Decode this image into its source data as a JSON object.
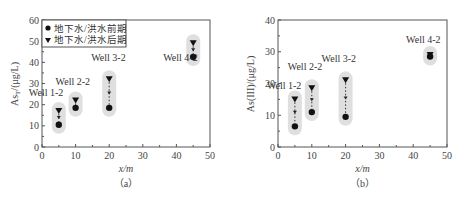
{
  "chart_data": [
    {
      "type": "scatter",
      "panel": "(a)",
      "title": "",
      "xlabel": "x/m",
      "ylabel": "As_T/(μg/L)",
      "xlim": [
        0,
        50
      ],
      "ylim": [
        0,
        60
      ],
      "xticks": [
        0,
        10,
        20,
        30,
        40,
        50
      ],
      "yticks": [
        0,
        10,
        20,
        30,
        40,
        50,
        60
      ],
      "legend": [
        "地下水/洪水前期",
        "地下水/洪水后期"
      ],
      "legend_position": "upper left",
      "grid": false,
      "series": [
        {
          "name": "地下水/洪水前期",
          "marker": "circle",
          "x": [
            5,
            10,
            20,
            45
          ],
          "values": [
            10.5,
            18.5,
            18.5,
            42.5
          ]
        },
        {
          "name": "地下水/洪水后期",
          "marker": "triangle-down",
          "x": [
            5,
            10,
            20,
            45
          ],
          "values": [
            17,
            22,
            32,
            49
          ]
        }
      ],
      "annotations": [
        {
          "text": "Well 1-2",
          "x": 5
        },
        {
          "text": "Well 2-2",
          "x": 10
        },
        {
          "text": "Well 3-2",
          "x": 20
        },
        {
          "text": "Well 4-2",
          "x": 45
        }
      ]
    },
    {
      "type": "scatter",
      "panel": "(b)",
      "title": "",
      "xlabel": "x/m",
      "ylabel": "As(III)/(μg/L)",
      "xlim": [
        0,
        50
      ],
      "ylim": [
        0,
        40
      ],
      "xticks": [
        0,
        10,
        20,
        30,
        40,
        50
      ],
      "yticks": [
        0,
        10,
        20,
        30,
        40
      ],
      "legend": [],
      "grid": false,
      "series": [
        {
          "name": "地下水/洪水前期",
          "marker": "circle",
          "x": [
            5,
            10,
            20,
            45
          ],
          "values": [
            6.5,
            11,
            9.5,
            28.5
          ]
        },
        {
          "name": "地下水/洪水后期",
          "marker": "triangle-down",
          "x": [
            5,
            10,
            20,
            45
          ],
          "values": [
            15,
            18.5,
            21,
            29
          ]
        }
      ],
      "annotations": [
        {
          "text": "Well 1-2",
          "x": 5
        },
        {
          "text": "Well 2-2",
          "x": 10
        },
        {
          "text": "Well 3-2",
          "x": 20
        },
        {
          "text": "Well 4-2",
          "x": 45
        }
      ]
    }
  ],
  "panel_a": {
    "caption": "（a）",
    "xlabel": "x/m",
    "ylabel": "As",
    "ylabel_sub": "T",
    "ylabel_unit": "/(μg/L)",
    "legend": {
      "item1": "地下水/洪水前期",
      "item2": "地下水/洪水后期"
    },
    "yticks": [
      "0",
      "10",
      "20",
      "30",
      "40",
      "50",
      "60"
    ],
    "xticks": [
      "0",
      "10",
      "20",
      "30",
      "40",
      "50"
    ],
    "wells": [
      "Well 1-2",
      "Well 2-2",
      "Well 3-2",
      "Well 4-2"
    ]
  },
  "panel_b": {
    "caption": "（b）",
    "xlabel": "x/m",
    "ylabel": "As(III)/(μg/L)",
    "yticks": [
      "0",
      "10",
      "20",
      "30",
      "40"
    ],
    "xticks": [
      "0",
      "10",
      "20",
      "30",
      "40",
      "50"
    ],
    "wells": [
      "Well 1-2",
      "Well 2-2",
      "Well 3-2",
      "Well 4-2"
    ]
  },
  "colors": {
    "axis": "#555555",
    "marker": "#111111",
    "halo": "#d9d9d9"
  }
}
